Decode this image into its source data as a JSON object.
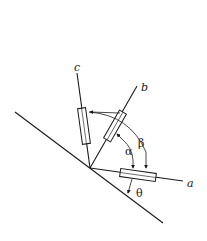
{
  "diagram": {
    "labels": {
      "axis_a": "a",
      "axis_b": "b",
      "axis_c": "c",
      "angle_alpha": "α",
      "angle_beta": "β",
      "angle_theta": "θ"
    },
    "colors": {
      "line": "#1a1a1a",
      "background": "#ffffff"
    }
  }
}
